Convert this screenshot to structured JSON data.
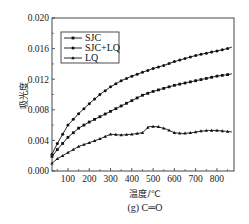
{
  "chart_data": {
    "type": "line",
    "title": "",
    "caption": "(g) C═O",
    "xlabel": "温度/℃",
    "ylabel": "吸光度",
    "xlim": [
      25,
      880
    ],
    "ylim": [
      0.0,
      0.02
    ],
    "xticks": [
      100,
      200,
      300,
      400,
      500,
      600,
      700,
      800
    ],
    "xtick_labels": [
      "100",
      "200",
      "300",
      "400",
      "500",
      "600",
      "700",
      "800"
    ],
    "yticks": [
      0.0,
      0.004,
      0.008,
      0.012,
      0.016,
      0.02
    ],
    "ytick_labels": [
      "0.000",
      "0.004",
      "0.008",
      "0.012",
      "0.016",
      "0.020"
    ],
    "grid": false,
    "legend_position": "upper left",
    "series": [
      {
        "name": "SJC",
        "marker": "square",
        "x": [
          25,
          50,
          100,
          150,
          200,
          250,
          300,
          350,
          400,
          450,
          500,
          550,
          600,
          650,
          700,
          750,
          800,
          850,
          870
        ],
        "values": [
          0.0019,
          0.0028,
          0.0044,
          0.0056,
          0.0064,
          0.0071,
          0.0078,
          0.0085,
          0.0092,
          0.0099,
          0.0104,
          0.0108,
          0.0112,
          0.0115,
          0.0118,
          0.0121,
          0.0124,
          0.0126,
          0.0127
        ]
      },
      {
        "name": "SJC+LQ",
        "marker": "circle",
        "x": [
          25,
          50,
          100,
          150,
          200,
          250,
          300,
          350,
          400,
          450,
          500,
          550,
          600,
          650,
          700,
          750,
          800,
          850,
          870
        ],
        "values": [
          0.0022,
          0.0036,
          0.006,
          0.0075,
          0.0088,
          0.01,
          0.011,
          0.0118,
          0.0124,
          0.0129,
          0.0134,
          0.0138,
          0.0143,
          0.0147,
          0.0151,
          0.0154,
          0.0157,
          0.016,
          0.0162
        ]
      },
      {
        "name": "LQ",
        "marker": "triangle",
        "x": [
          25,
          50,
          100,
          150,
          200,
          250,
          300,
          350,
          400,
          450,
          480,
          520,
          560,
          600,
          640,
          680,
          720,
          760,
          800,
          840,
          870
        ],
        "values": [
          0.001,
          0.0016,
          0.0024,
          0.0032,
          0.0037,
          0.0042,
          0.0048,
          0.0047,
          0.0048,
          0.005,
          0.0058,
          0.0058,
          0.0055,
          0.005,
          0.0049,
          0.005,
          0.0052,
          0.0053,
          0.0053,
          0.0052,
          0.0051
        ]
      }
    ]
  },
  "colors": {
    "line": "#111111",
    "frame": "#333333",
    "background": "#ffffff"
  }
}
